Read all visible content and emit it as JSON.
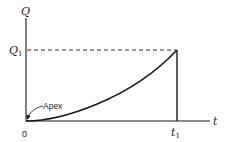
{
  "diagram": {
    "y_axis_label": "Q",
    "y_marker_label": "Q",
    "y_marker_subscript": "1",
    "x_axis_label": "t",
    "x_marker_label": "t",
    "x_marker_subscript": "1",
    "origin_label": "0",
    "annotation": "Apex",
    "colors": {
      "line": "#1a1a1a",
      "background": "#ffffff"
    }
  }
}
